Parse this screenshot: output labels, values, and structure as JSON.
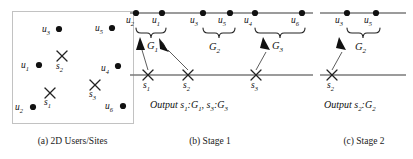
{
  "figure": {
    "title_hidden": "",
    "panels": [
      {
        "id": "a",
        "caption": "(a) 2D Users/Sites",
        "type": "scatter-box",
        "box": {
          "x": 12,
          "y": 11,
          "w": 121,
          "h": 112,
          "border_color": "#bdbdbd"
        },
        "users": [
          {
            "label": "u",
            "sub": "3",
            "x": 59,
            "y": 29,
            "label_x": 44,
            "label_y": 37
          },
          {
            "label": "u",
            "sub": "5",
            "x": 112,
            "y": 28,
            "label_x": 97,
            "label_y": 36
          },
          {
            "label": "u",
            "sub": "1",
            "x": 39,
            "y": 65,
            "label_x": 24,
            "label_y": 73
          },
          {
            "label": "u",
            "sub": "4",
            "x": 118,
            "y": 66,
            "label_x": 103,
            "label_y": 76
          },
          {
            "label": "u",
            "sub": "2",
            "x": 33,
            "y": 107,
            "label_x": 18,
            "label_y": 116
          },
          {
            "label": "u",
            "sub": "6",
            "x": 123,
            "y": 106,
            "label_x": 108,
            "label_y": 115
          }
        ],
        "sites": [
          {
            "label": "s",
            "sub": "2",
            "x": 62,
            "y": 56,
            "label_x": 56,
            "label_y": 70
          },
          {
            "label": "s",
            "sub": "3",
            "x": 95,
            "y": 85,
            "label_x": 89,
            "label_y": 99
          },
          {
            "label": "s",
            "sub": "1",
            "x": 50,
            "y": 93,
            "label_x": 44,
            "label_y": 107
          }
        ]
      },
      {
        "id": "b",
        "caption": "(b) Stage 1",
        "output": "Output s₁:G₁, s₃:G₃",
        "output_parts": {
          "word": "Output",
          "a_site": "s",
          "a_site_sub": "1",
          "a_group": "G",
          "a_group_sub": "1",
          "b_site": "s",
          "b_site_sub": "3",
          "b_group": "G",
          "b_group_sub": "3"
        },
        "top_line": {
          "x1": 130,
          "x2": 313,
          "y": 13
        },
        "bottom_line": {
          "x1": 130,
          "x2": 313,
          "y": 75
        },
        "users": [
          {
            "label": "u",
            "sub": "2",
            "x": 136,
            "label_x": 127,
            "label_y": 24
          },
          {
            "label": "u",
            "sub": "1",
            "x": 162,
            "label_x": 153,
            "label_y": 24
          },
          {
            "label": "u",
            "sub": "3",
            "x": 203,
            "label_x": 191,
            "label_y": 24
          },
          {
            "label": "u",
            "sub": "5",
            "x": 230,
            "label_x": 220,
            "label_y": 24
          },
          {
            "label": "u",
            "sub": "4",
            "x": 255,
            "label_x": 246,
            "label_y": 24
          },
          {
            "label": "u",
            "sub": "6",
            "x": 302,
            "label_x": 290,
            "label_y": 24
          }
        ],
        "sites": [
          {
            "label": "s",
            "sub": "1",
            "x": 148,
            "label_x": 143,
            "label_y": 89
          },
          {
            "label": "s",
            "sub": "2",
            "x": 188,
            "label_x": 183,
            "label_y": 89
          },
          {
            "label": "s",
            "sub": "3",
            "x": 256,
            "label_x": 251,
            "label_y": 89
          }
        ],
        "groups": [
          {
            "label": "G",
            "sub": "1",
            "x1": 136,
            "x2": 162,
            "label_x": 146,
            "label_y": 48
          },
          {
            "label": "G",
            "sub": "2",
            "x1": 203,
            "x2": 230,
            "label_x": 211,
            "label_y": 49
          },
          {
            "label": "G",
            "sub": "3",
            "x1": 255,
            "x2": 302,
            "label_x": 280,
            "label_y": 48
          }
        ],
        "arrows": [
          {
            "from_x": 148,
            "from_y": 70,
            "to_x": 140,
            "to_y": 41,
            "name": "arrow-s1-to-G1-left"
          },
          {
            "from_x": 188,
            "from_y": 70,
            "to_x": 160,
            "to_y": 41,
            "name": "arrow-s2-to-G1-right"
          },
          {
            "from_x": 256,
            "from_y": 70,
            "to_x": 264,
            "to_y": 41,
            "name": "arrow-s3-to-G3"
          }
        ]
      },
      {
        "id": "c",
        "caption": "(c) Stage 2",
        "output": "Output s₂:G₂",
        "output_parts": {
          "word": "Output",
          "a_site": "s",
          "a_site_sub": "2",
          "a_group": "G",
          "a_group_sub": "2"
        },
        "top_line": {
          "x1": 320,
          "x2": 405,
          "y": 13
        },
        "bottom_line": {
          "x1": 320,
          "x2": 405,
          "y": 75
        },
        "users": [
          {
            "label": "u",
            "sub": "3",
            "x": 347,
            "label_x": 336,
            "label_y": 24
          },
          {
            "label": "u",
            "sub": "5",
            "x": 376,
            "label_x": 365,
            "label_y": 24
          }
        ],
        "sites": [
          {
            "label": "s",
            "sub": "2",
            "x": 332,
            "label_x": 327,
            "label_y": 89
          }
        ],
        "groups": [
          {
            "label": "G",
            "sub": "2",
            "x1": 347,
            "x2": 376,
            "label_x": 355,
            "label_y": 49
          }
        ],
        "arrows": [
          {
            "from_x": 332,
            "from_y": 70,
            "to_x": 340,
            "to_y": 41,
            "name": "arrow-s2-to-G2"
          }
        ]
      }
    ],
    "style": {
      "line_color": "#6e6e6e",
      "dot_color": "#111111",
      "cross_color": "#222222",
      "arrow_color": "#111111",
      "text_color": "#111111"
    }
  }
}
